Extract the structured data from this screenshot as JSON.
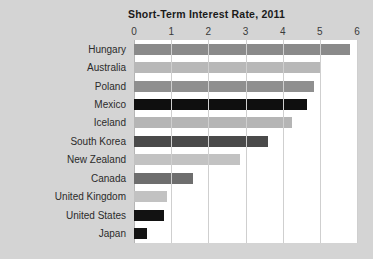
{
  "chart_data": {
    "type": "bar",
    "orientation": "horizontal",
    "title": "Short-Term Interest Rate, 2011",
    "xlabel": "",
    "ylabel": "",
    "xlim": [
      0,
      6
    ],
    "xticks": [
      0,
      1,
      2,
      3,
      4,
      5,
      6
    ],
    "xtick_labels": [
      "0",
      "1",
      "2",
      "3",
      "4",
      "5",
      "6"
    ],
    "grid": true,
    "legend": false,
    "categories": [
      "Hungary",
      "Australia",
      "Poland",
      "Mexico",
      "Iceland",
      "South Korea",
      "New Zealand",
      "Canada",
      "United Kingdom",
      "United States",
      "Japan"
    ],
    "values": [
      5.8,
      5.0,
      4.85,
      4.65,
      4.25,
      3.6,
      2.85,
      1.6,
      0.9,
      0.8,
      0.35
    ],
    "bar_colors": [
      "#8a8a8a",
      "#b8b8b8",
      "#8f8f8f",
      "#0f0f0f",
      "#b5b5b5",
      "#4a4a4a",
      "#c2c2c2",
      "#6e6e6e",
      "#c2c2c2",
      "#121212",
      "#141414"
    ]
  },
  "colors": {
    "page_background": "#d4d4d4",
    "plot_background": "#ffffff",
    "gridline": "#cfcfcf",
    "text": "#2b2b2b",
    "title_text": "#1a1a1a"
  }
}
